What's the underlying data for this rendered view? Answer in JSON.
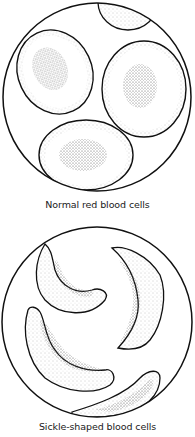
{
  "panels": [
    {
      "id": "normal",
      "caption": "Normal red blood cells",
      "cell_type": "normal-red-blood-cell",
      "cell_count": 4
    },
    {
      "id": "sickle",
      "caption": "Sickle-shaped blood cells",
      "cell_type": "sickle-cell",
      "cell_count": 4
    }
  ],
  "colors": {
    "outline": "#111111",
    "stipple": "#555555",
    "background": "#ffffff"
  }
}
